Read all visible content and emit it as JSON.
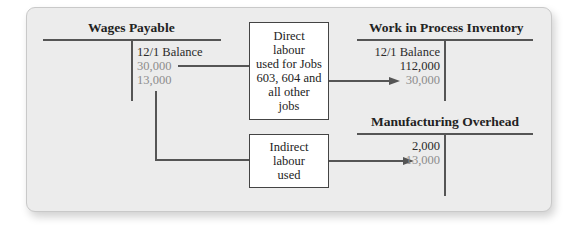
{
  "accounts": {
    "wages_payable": {
      "title": "Wages Payable",
      "credit_side": {
        "label": "12/1 Balance",
        "entries": [
          "30,000",
          "13,000"
        ]
      }
    },
    "wip_inventory": {
      "title": "Work in Process Inventory",
      "debit_side": {
        "label": "12/1 Balance",
        "balance": "112,000",
        "entries": [
          "30,000"
        ]
      }
    },
    "manufacturing_overhead": {
      "title": "Manufacturing Overhead",
      "debit_side": {
        "entries": [
          "2,000",
          "13,000"
        ]
      }
    }
  },
  "flows": {
    "direct_labour": {
      "lines": [
        "Direct",
        "labour",
        "used for Jobs",
        "603, 604 and",
        "all other",
        "jobs"
      ]
    },
    "indirect_labour": {
      "lines": [
        "Indirect",
        "labour",
        "used"
      ]
    }
  },
  "colors": {
    "line": "#555555",
    "highlight_text": "#8c8c8c",
    "panel_bg": "#ececec"
  }
}
